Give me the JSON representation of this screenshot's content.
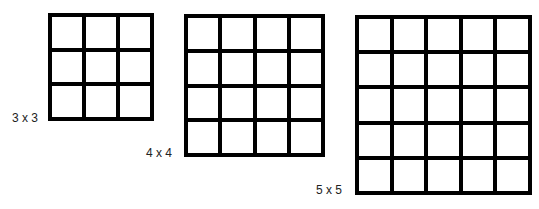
{
  "figure": {
    "grids": [
      {
        "label": "3 x 3",
        "rows": 3,
        "cols": 3
      },
      {
        "label": "4 x 4",
        "rows": 4,
        "cols": 4
      },
      {
        "label": "5 x 5",
        "rows": 5,
        "cols": 5
      }
    ],
    "colors": {
      "line": "#000000",
      "cell": "#ffffff",
      "label": "#222222"
    }
  }
}
